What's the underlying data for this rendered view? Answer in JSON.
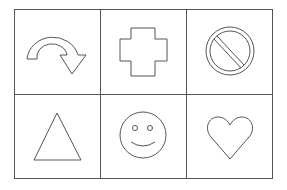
{
  "diagram": {
    "type": "shape-grid",
    "rows": 2,
    "columns": 3,
    "line_color": "#555555",
    "background": "#ffffff",
    "cells": [
      {
        "row": 0,
        "col": 0,
        "shape": "curved-arrow",
        "label": "Curved arrow"
      },
      {
        "row": 0,
        "col": 1,
        "shape": "cross",
        "label": "Cross"
      },
      {
        "row": 0,
        "col": 2,
        "shape": "prohibited-sign",
        "label": "No symbol"
      },
      {
        "row": 1,
        "col": 0,
        "shape": "triangle",
        "label": "Triangle"
      },
      {
        "row": 1,
        "col": 1,
        "shape": "smiley-face",
        "label": "Smiley face"
      },
      {
        "row": 1,
        "col": 2,
        "shape": "heart",
        "label": "Heart"
      }
    ]
  }
}
